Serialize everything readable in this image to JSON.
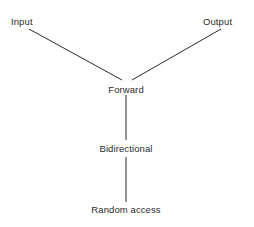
{
  "diagram": {
    "type": "hierarchy-tree",
    "background_color": "#ffffff",
    "line_color": "#2b2b2b",
    "text_color": "#2b2b2b",
    "nodes": [
      {
        "id": "input",
        "label": "Input",
        "x": 11,
        "y": 16,
        "anchor": "left"
      },
      {
        "id": "output",
        "label": "Output",
        "x": 203,
        "y": 16,
        "anchor": "left"
      },
      {
        "id": "forward",
        "label": "Forward",
        "x": 126,
        "y": 84,
        "anchor": "center"
      },
      {
        "id": "bidirectional",
        "label": "Bidirectional",
        "x": 126,
        "y": 143,
        "anchor": "center"
      },
      {
        "id": "random_access",
        "label": "Random access",
        "x": 126,
        "y": 204,
        "anchor": "center"
      }
    ],
    "edges": [
      {
        "id": "input-forward",
        "from": "input",
        "to": "forward",
        "x1": 29,
        "y1": 29,
        "x2": 122,
        "y2": 80
      },
      {
        "id": "output-forward",
        "from": "output",
        "to": "forward",
        "x1": 221,
        "y1": 29,
        "x2": 132,
        "y2": 80
      },
      {
        "id": "forward-bidirectional",
        "from": "forward",
        "to": "bidirectional",
        "x1": 126,
        "y1": 95,
        "x2": 126,
        "y2": 140
      },
      {
        "id": "bidirectional-random-access",
        "from": "bidirectional",
        "to": "random_access",
        "x1": 126,
        "y1": 157,
        "x2": 126,
        "y2": 202
      }
    ]
  }
}
